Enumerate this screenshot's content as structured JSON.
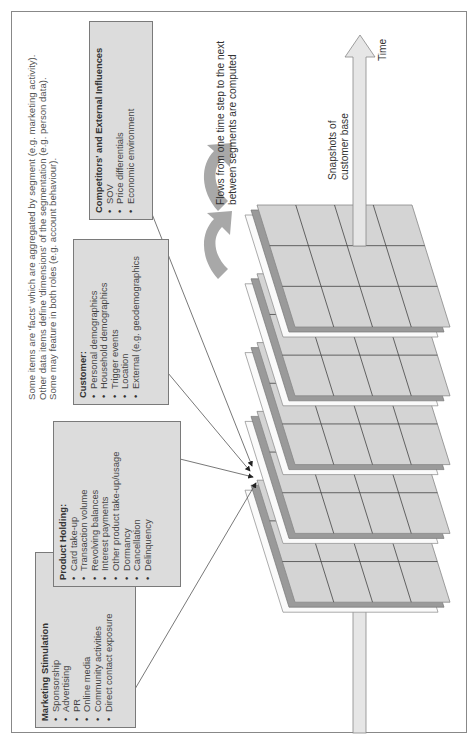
{
  "note": {
    "lines": [
      "Some items are 'facts' which are aggregated by segment (e.g. marketing activity).",
      "Other data items define 'dimensions' of the segmentation (e.g. person data).",
      "Some may feature in both roles (e.g. account behaviour)."
    ]
  },
  "boxes": {
    "marketing": {
      "title": "Marketing Stimulation",
      "items": [
        "Sponsorship",
        "Advertising",
        "PR",
        "Online media",
        "Community activities",
        "Direct contact exposure"
      ]
    },
    "product": {
      "title": "Product Holding:",
      "items": [
        "Card take-up",
        "Transaction volume",
        "Revolving balances",
        "Interest payments",
        "Other product take-up/usage",
        "Dormancy",
        "Cancellation",
        "Delinquency"
      ]
    },
    "customer": {
      "title": "Customer:",
      "items": [
        "Personal demographics",
        "Household demographics",
        "Trigger events",
        "Location",
        "External (e.g. geodemographics"
      ]
    },
    "competitors": {
      "title": "Competitors' and External Influences",
      "items": [
        "SOV",
        "Price differentials",
        "Economic environment"
      ]
    }
  },
  "labels": {
    "flows_line1": "Flows from one time step to the next",
    "flows_line2": "between segments are computed",
    "snapshots_line1": "Snapshots of",
    "snapshots_line2": "customer base",
    "time": "Time"
  },
  "diagram": {
    "slab_count": 5,
    "grid": {
      "columns": 4,
      "rows": 3
    },
    "colors": {
      "slab_fill": "#d4d4d4",
      "slab_dark": "#9a9a9a",
      "grid_line": "#444444",
      "arrow_fill": "#e6e6e6",
      "curved_arrow": "#a8a8a8",
      "box_fill": "#dcdcdc"
    }
  }
}
